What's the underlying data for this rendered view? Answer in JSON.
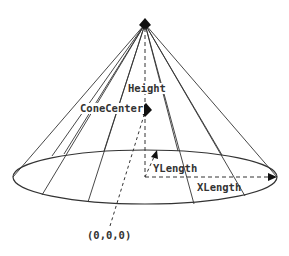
{
  "diagram": {
    "labels": {
      "height": "Height",
      "cone_center": "ConeCenter",
      "y_length": "YLength",
      "x_length": "XLength",
      "origin": "(0,0,0)"
    },
    "colors": {
      "line": "#333333",
      "background": "#ffffff"
    },
    "shapes": {
      "apex": {
        "x": 145,
        "y": 24
      },
      "base_center": {
        "x": 145,
        "y": 177
      },
      "base_rx": 133,
      "base_ry": 27,
      "cone_center_marker": {
        "x": 145,
        "y": 110
      },
      "origin_point": {
        "x": 108,
        "y": 233
      },
      "y_length_tip": {
        "x": 156,
        "y": 151
      }
    }
  }
}
